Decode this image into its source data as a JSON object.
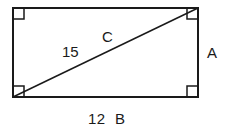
{
  "diagram": {
    "type": "rectangle-with-diagonal",
    "title": "",
    "stroke_color": "#1a1a1a",
    "background_color": "#ffffff",
    "rectangle": {
      "left": 13,
      "top": 8,
      "right": 198,
      "bottom": 97,
      "width": 185,
      "height": 89,
      "edge_stroke_width": 2
    },
    "diagonal": {
      "from": "bottom-left",
      "to": "top-right",
      "x1": 13,
      "y1": 97,
      "x2": 198,
      "y2": 8,
      "stroke_width": 1.5
    },
    "right_angle_markers": {
      "count": 4,
      "size": 11,
      "stroke_width": 1.5,
      "corners": [
        "top-left",
        "top-right",
        "bottom-left",
        "bottom-right"
      ]
    },
    "labels": {
      "diagonal_length": "15",
      "diagonal_name": "C",
      "right_side_name": "A",
      "bottom_measure": "12",
      "bottom_name": "B",
      "bottom_combined": "12  B"
    }
  }
}
